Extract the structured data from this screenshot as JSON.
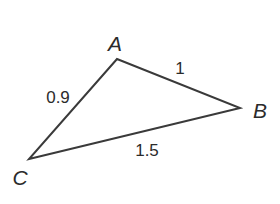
{
  "figure": {
    "type": "triangle",
    "stroke_color": "#3a3a3a",
    "text_color": "#2b2b2b",
    "background": "#ffffff"
  },
  "vertices": {
    "A": {
      "label": "A",
      "x": 117,
      "y": 59,
      "label_x": 115,
      "label_y": 43
    },
    "B": {
      "label": "B",
      "x": 240,
      "y": 108,
      "label_x": 260,
      "label_y": 110
    },
    "C": {
      "label": "C",
      "x": 29,
      "y": 159,
      "label_x": 20,
      "label_y": 177
    }
  },
  "sides": {
    "AC": {
      "label": "0.9",
      "label_x": 58,
      "label_y": 97
    },
    "AB": {
      "label": "1",
      "label_x": 180,
      "label_y": 68
    },
    "BC": {
      "label": "1.5",
      "label_x": 147,
      "label_y": 150
    }
  }
}
